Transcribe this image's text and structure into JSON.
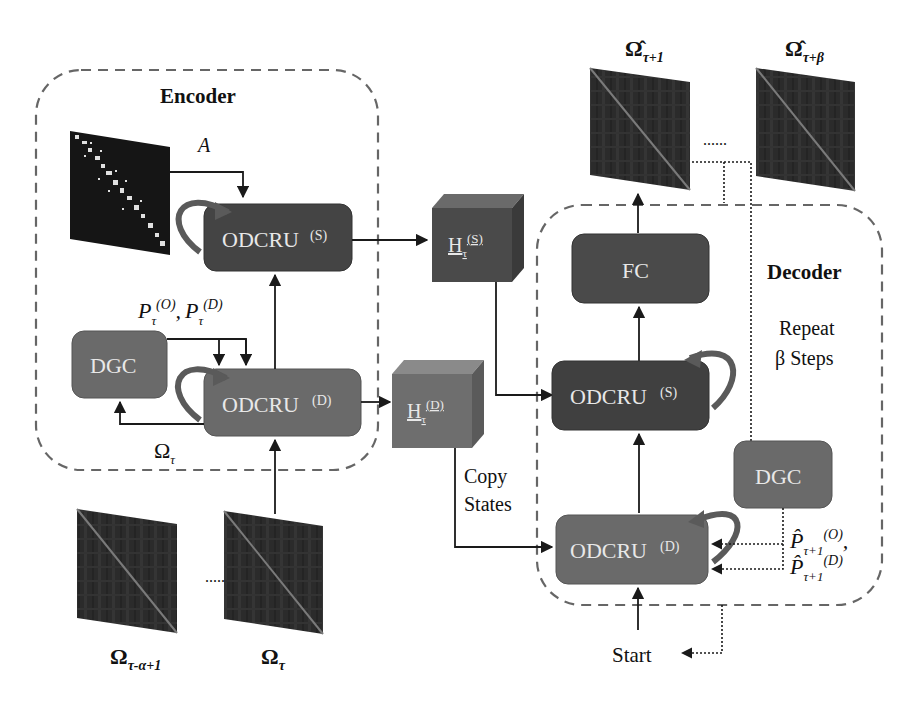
{
  "diagram": {
    "encoder": {
      "title": "Encoder",
      "adjacency_label": "A",
      "odcru_s": {
        "label": "ODCRU",
        "sup": "(S)"
      },
      "odcru_d": {
        "label": "ODCRU",
        "sup": "(D)"
      },
      "dgc": {
        "label": "DGC"
      },
      "p_label": {
        "p1": "P",
        "sub1": "τ",
        "sup1": "(O)",
        "sep": ",",
        "p2": "P",
        "sub2": "τ",
        "sup2": "(D)"
      },
      "omega_feedback": {
        "base": "Ω",
        "sub": "τ"
      }
    },
    "inputs": {
      "first": {
        "base": "Ω",
        "sub": "τ-α+1"
      },
      "last": {
        "base": "Ω",
        "sub": "τ"
      },
      "ellipsis": "......"
    },
    "hidden": {
      "h_s": {
        "base": "H",
        "sub": "τ",
        "sup": "(S)"
      },
      "h_d": {
        "base": "H",
        "sub": "τ",
        "sup": "(D)"
      },
      "copy_states_line1": "Copy",
      "copy_states_line2": "States"
    },
    "decoder": {
      "title": "Decoder",
      "repeat_line1": "Repeat",
      "repeat_line2": "β Steps",
      "fc": {
        "label": "FC"
      },
      "odcru_s": {
        "label": "ODCRU",
        "sup": "(S)"
      },
      "odcru_d": {
        "label": "ODCRU",
        "sup": "(D)"
      },
      "dgc": {
        "label": "DGC"
      },
      "p_hat": {
        "p": "P̂",
        "sub": "τ+1",
        "sup1": "(O)",
        "sup2": "(D)",
        "sep": ","
      },
      "start": "Start"
    },
    "outputs": {
      "first": {
        "base": "Ω̂",
        "sub": "τ+1"
      },
      "last": {
        "base": "Ω̂",
        "sub": "τ+β"
      },
      "ellipsis": "......"
    },
    "colors": {
      "dark_box": "#444444",
      "mid_box": "#6a6a6a",
      "dashed_border": "#666666",
      "arrow": "#1a1a1a",
      "box_text": "#e8e8e8"
    }
  }
}
